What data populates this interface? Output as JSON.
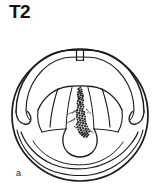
{
  "figure": {
    "title": "T2",
    "panel_letter": "a",
    "caption_text": "",
    "type": "anatomical-line-drawing",
    "colors": {
      "stroke": "#1a1a1a",
      "background": "#ffffff",
      "lesion_fill": "#2a2a2a"
    },
    "parts": [
      {
        "name": "outer-circle",
        "label": ""
      },
      {
        "name": "spinous-process-notch",
        "label": ""
      },
      {
        "name": "vertebral-arch",
        "label": ""
      },
      {
        "name": "left-transverse-process",
        "label": ""
      },
      {
        "name": "right-transverse-process",
        "label": ""
      },
      {
        "name": "left-lamina",
        "label": ""
      },
      {
        "name": "right-lamina",
        "label": ""
      },
      {
        "name": "vertebral-body",
        "label": ""
      },
      {
        "name": "lesion-stipple",
        "label": ""
      }
    ]
  }
}
